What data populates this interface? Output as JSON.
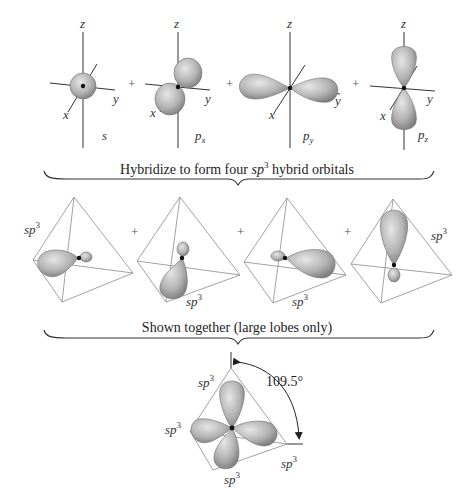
{
  "colors": {
    "lobe_light": "#d9d9d9",
    "lobe_dark": "#8c8c8c",
    "axis": "#333333",
    "tetrahedron": "#8a8a8a",
    "nucleus": "#111111"
  },
  "atomic_orbitals": [
    {
      "name": "s",
      "sub": "",
      "axes": {
        "x": "x",
        "y": "y",
        "z": "z"
      }
    },
    {
      "name": "p",
      "sub": "x",
      "axes": {
        "x": "x",
        "y": "y",
        "z": "z"
      }
    },
    {
      "name": "p",
      "sub": "y",
      "axes": {
        "x": "x",
        "y": "y",
        "z": "z"
      }
    },
    {
      "name": "p",
      "sub": "z",
      "axes": {
        "x": "x",
        "y": "y",
        "z": "z"
      }
    }
  ],
  "plus_sign": "+",
  "caption1": {
    "pre": "Hybridize to form four ",
    "sp": "sp",
    "sup": "3",
    "post": " hybrid orbitals"
  },
  "hybrid_orbitals": [
    {
      "label": "sp",
      "sup": "3"
    },
    {
      "label": "sp",
      "sup": "3"
    },
    {
      "label": "sp",
      "sup": "3"
    },
    {
      "label": "sp",
      "sup": "3"
    }
  ],
  "caption2": "Shown together (large lobes only)",
  "combined": {
    "angle_label": "109.5°",
    "labels": [
      {
        "label": "sp",
        "sup": "3"
      },
      {
        "label": "sp",
        "sup": "3"
      },
      {
        "label": "sp",
        "sup": "3"
      },
      {
        "label": "sp",
        "sup": "3"
      }
    ]
  }
}
